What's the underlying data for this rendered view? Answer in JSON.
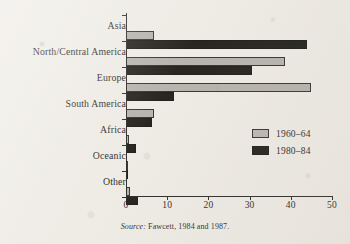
{
  "chart_data": {
    "type": "bar",
    "orientation": "horizontal",
    "title": "",
    "subtitle": "",
    "xlabel": "",
    "ylabel": "",
    "xlim": [
      0,
      50
    ],
    "ylim": null,
    "grid": false,
    "legend_position": "center-right",
    "xticks": [
      0,
      10,
      20,
      30,
      40,
      50
    ],
    "xtick_labels": [
      "0",
      "10",
      "20",
      "30",
      "40",
      "50"
    ],
    "categories": [
      "Asia",
      "North/Central America",
      "Europe",
      "South America",
      "Africa",
      "Oceanic",
      "Other"
    ],
    "series": [
      {
        "name": "1960–64",
        "color": "#b3b0aa",
        "values": [
          6.8,
          38.6,
          45.0,
          6.8,
          0.7,
          0.4,
          1.0
        ]
      },
      {
        "name": "1980–84",
        "color": "#16150f",
        "values": [
          44.0,
          30.5,
          11.7,
          6.3,
          2.5,
          0.6,
          3.0
        ]
      }
    ]
  },
  "legend": {
    "items": [
      {
        "label": "1960–64",
        "swatch": "gray"
      },
      {
        "label": "1980–84",
        "swatch": "black"
      }
    ]
  },
  "source_note": {
    "label": "Source:",
    "text": "Fawcett, 1984 and 1987."
  },
  "colors": {
    "background": "#efece6",
    "ink": "#1b1a18",
    "series_1960_64": "#b3b0aa",
    "series_1980_84": "#16150f"
  }
}
